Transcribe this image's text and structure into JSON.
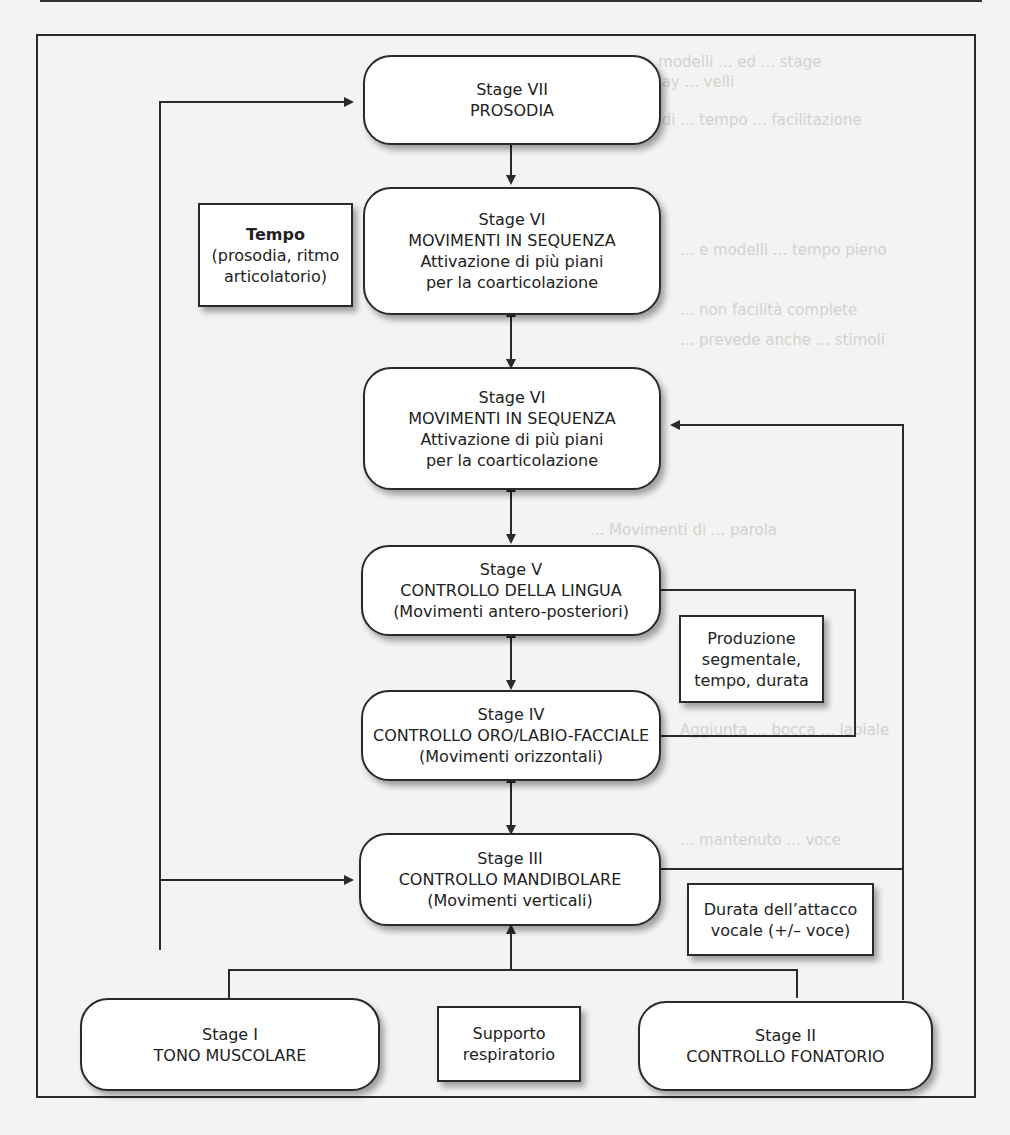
{
  "figure": {
    "stages": [
      {
        "id": "stage-vii",
        "title": "Stage VII",
        "lines": [
          "PROSODIA"
        ]
      },
      {
        "id": "stage-vi-a",
        "title": "Stage VI",
        "lines": [
          "MOVIMENTI IN SEQUENZA",
          "Attivazione di più piani",
          "per la coarticolazione"
        ]
      },
      {
        "id": "stage-vi-b",
        "title": "Stage VI",
        "lines": [
          "MOVIMENTI IN SEQUENZA",
          "Attivazione di più piani",
          "per la coarticolazione"
        ]
      },
      {
        "id": "stage-v",
        "title": "Stage V",
        "lines": [
          "CONTROLLO DELLA LINGUA",
          "(Movimenti antero-posteriori)"
        ]
      },
      {
        "id": "stage-iv",
        "title": "Stage IV",
        "lines": [
          "CONTROLLO ORO/LABIO-FACCIALE",
          "(Movimenti orizzontali)"
        ]
      },
      {
        "id": "stage-iii",
        "title": "Stage III",
        "lines": [
          "CONTROLLO MANDIBOLARE",
          "(Movimenti verticali)"
        ]
      },
      {
        "id": "stage-i",
        "title": "Stage I",
        "lines": [
          "TONO MUSCOLARE"
        ]
      },
      {
        "id": "stage-ii",
        "title": "Stage II",
        "lines": [
          "CONTROLLO FONATORIO"
        ]
      }
    ],
    "notes": {
      "tempo": {
        "title": "Tempo",
        "lines": [
          "(prosodia, ritmo",
          "articolatorio)"
        ]
      },
      "produzione": {
        "lines": [
          "Produzione",
          "segmentale,",
          "tempo, durata"
        ]
      },
      "durata": {
        "lines": [
          "Durata dell’attacco",
          "vocale (+/– voce)"
        ]
      },
      "supporto": {
        "lines": [
          "Supporto",
          "respiratorio"
        ]
      }
    },
    "connections": [
      {
        "from": "stage-vii",
        "to": "stage-vi-a",
        "type": "arrow-down"
      },
      {
        "from": "stage-vi-a",
        "to": "stage-vi-b",
        "type": "bidirectional"
      },
      {
        "from": "stage-vi-b",
        "to": "stage-v",
        "type": "bidirectional"
      },
      {
        "from": "stage-v",
        "to": "stage-iv",
        "type": "bidirectional"
      },
      {
        "from": "stage-iv",
        "to": "stage-iii",
        "type": "bidirectional"
      },
      {
        "from": "stage-i + stage-ii",
        "to": "stage-iii",
        "type": "arrow-up"
      },
      {
        "from": "stage-i",
        "to": "stage-vii",
        "type": "feedback-left-outer"
      },
      {
        "from": "stage-i",
        "to": "stage-iii",
        "type": "feedback-left-inner"
      },
      {
        "from": "stage-ii",
        "to": "stage-vi-b",
        "type": "feedback-right"
      },
      {
        "from": "stage-v",
        "to": "stage-iv",
        "type": "side-bracket"
      },
      {
        "from": "stage-iii",
        "to": "stage-ii",
        "type": "side-bracket"
      }
    ],
    "colors": {
      "ink": "#2a2a2a",
      "box_fill": "#ffffff",
      "page": "#f3f3f1"
    }
  }
}
